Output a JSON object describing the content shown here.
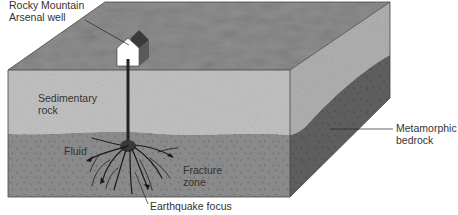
{
  "diagram": {
    "type": "geologic block diagram",
    "layers": [
      {
        "name": "surface",
        "color": "#8e8e8e"
      },
      {
        "name": "sedimentary_rock",
        "color": "#c4c4c4"
      },
      {
        "name": "sedimentary_rock_side",
        "color": "#b2b2b2"
      },
      {
        "name": "metamorphic_bedrock",
        "color": "#8a8a8a"
      },
      {
        "name": "metamorphic_bedrock_side",
        "color": "#5e5e5e"
      }
    ]
  },
  "labels": {
    "well": {
      "line1": "Rocky Mountain",
      "line2": "Arsenal well"
    },
    "sedimentary": {
      "line1": "Sedimentary",
      "line2": "rock"
    },
    "fluid": "Fluid",
    "fracture": {
      "line1": "Fracture",
      "line2": "zone"
    },
    "metamorphic": {
      "line1": "Metamorphic",
      "line2": "bedrock"
    },
    "focus": "Earthquake focus"
  }
}
